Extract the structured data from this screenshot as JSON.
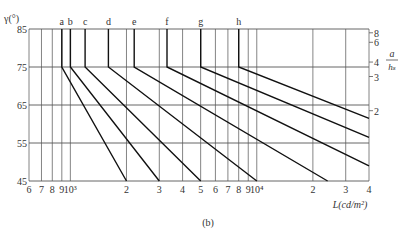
{
  "chart_data": {
    "type": "line",
    "title": "",
    "caption": "(b)",
    "ylabel": "γ(°)",
    "xlabel": "L(cd/m²)",
    "right_axis_label_num": "a",
    "right_axis_label_den": "h_s",
    "ylim": [
      45,
      85
    ],
    "y_ticks": [
      "85",
      "75",
      "65",
      "55",
      "45"
    ],
    "x_scale": "log",
    "xlim": [
      600,
      40000
    ],
    "x_ticks": [
      "6",
      "7",
      "8",
      "9",
      "10³",
      "2",
      "3",
      "4",
      "5",
      "6",
      "7",
      "8",
      "9",
      "10⁴",
      "2",
      "3",
      "4"
    ],
    "x_tick_values": [
      600,
      700,
      800,
      900,
      1000,
      2000,
      3000,
      4000,
      5000,
      6000,
      7000,
      8000,
      9000,
      10000,
      20000,
      30000,
      40000
    ],
    "right_ticks": [
      "8",
      "6",
      "4",
      "3",
      "2"
    ],
    "right_tick_gamma": [
      84.0,
      81.5,
      76.3,
      72.5,
      63.5
    ],
    "grid": true,
    "series": [
      {
        "name": "a",
        "points": [
          [
            900,
            85
          ],
          [
            900,
            75
          ],
          [
            2000,
            45
          ]
        ]
      },
      {
        "name": "b",
        "points": [
          [
            1000,
            85
          ],
          [
            1000,
            75
          ],
          [
            3000,
            45
          ]
        ]
      },
      {
        "name": "c",
        "points": [
          [
            1200,
            85
          ],
          [
            1200,
            75
          ],
          [
            5000,
            45
          ]
        ]
      },
      {
        "name": "d",
        "points": [
          [
            1600,
            85
          ],
          [
            1600,
            75
          ],
          [
            10000,
            45
          ]
        ]
      },
      {
        "name": "e",
        "points": [
          [
            2200,
            85
          ],
          [
            2200,
            75
          ],
          [
            24000,
            45
          ]
        ]
      },
      {
        "name": "f",
        "points": [
          [
            3300,
            85
          ],
          [
            3300,
            75
          ],
          [
            40000,
            49
          ]
        ]
      },
      {
        "name": "g",
        "points": [
          [
            5000,
            85
          ],
          [
            5000,
            75
          ],
          [
            40000,
            56.5
          ]
        ]
      },
      {
        "name": "h",
        "points": [
          [
            8000,
            85
          ],
          [
            8000,
            75
          ],
          [
            40000,
            61.5
          ]
        ]
      }
    ]
  }
}
